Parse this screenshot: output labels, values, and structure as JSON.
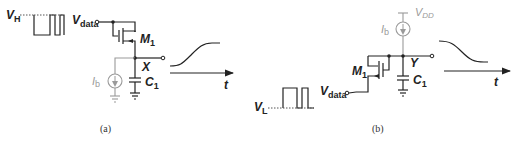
{
  "figure_a": {
    "caption": "(a)",
    "input_level_label": "V",
    "input_level_sub": "H",
    "input_node_label": "V",
    "input_node_sub": "data",
    "transistor_label": "M",
    "transistor_sub": "1",
    "output_node_label": "X",
    "current_source_label": "I",
    "current_source_sub": "b",
    "capacitor_label": "C",
    "capacitor_sub": "1",
    "time_axis_label": "t",
    "output_waveform": "rising"
  },
  "figure_b": {
    "caption": "(b)",
    "input_level_label": "V",
    "input_level_sub": "L",
    "input_node_label": "V",
    "input_node_sub": "data",
    "transistor_label": "M",
    "transistor_sub": "1",
    "output_node_label": "Y",
    "current_source_label": "I",
    "current_source_sub": "b",
    "supply_label": "V",
    "supply_sub": "DD",
    "capacitor_label": "C",
    "capacitor_sub": "1",
    "time_axis_label": "t",
    "output_waveform": "falling"
  },
  "colors": {
    "ink": "#222222",
    "gray": "#9a9a9a"
  }
}
